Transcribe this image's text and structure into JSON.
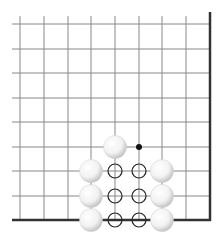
{
  "diagram": {
    "type": "go-board-corner",
    "visible_corner": "bottom-right",
    "grid": {
      "columns_x": [
        20,
        44,
        68,
        91,
        115,
        139,
        162,
        186,
        210
      ],
      "rows_y": [
        24,
        49,
        73,
        98,
        122,
        147,
        171,
        196,
        220
      ],
      "line_color": "#888888",
      "edge_color": "#333333"
    },
    "stones": [
      {
        "color": "white",
        "col": 4,
        "row": 5
      },
      {
        "color": "white",
        "col": 3,
        "row": 6
      },
      {
        "color": "white",
        "col": 3,
        "row": 7
      },
      {
        "color": "white",
        "col": 3,
        "row": 8
      },
      {
        "color": "white",
        "col": 6,
        "row": 6
      },
      {
        "color": "white",
        "col": 6,
        "row": 7
      },
      {
        "color": "white",
        "col": 6,
        "row": 8
      }
    ],
    "markers": [
      {
        "type": "black-dot",
        "col": 5,
        "row": 5
      },
      {
        "type": "circle",
        "col": 4,
        "row": 6
      },
      {
        "type": "circle",
        "col": 5,
        "row": 6
      },
      {
        "type": "circle",
        "col": 4,
        "row": 7
      },
      {
        "type": "circle",
        "col": 5,
        "row": 7
      },
      {
        "type": "circle",
        "col": 4,
        "row": 8
      },
      {
        "type": "circle",
        "col": 5,
        "row": 8
      }
    ]
  }
}
